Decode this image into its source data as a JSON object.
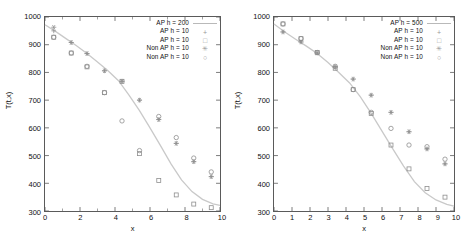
{
  "figure": {
    "background": "#ffffff",
    "panel_count": 2
  },
  "chart_data": [
    {
      "type": "scatter",
      "title": "",
      "xlabel": "x",
      "ylabel": "T(t,x)",
      "xlim": [
        0,
        10
      ],
      "ylim": [
        300,
        1000
      ],
      "xticks": [
        0,
        2,
        4,
        6,
        8,
        10
      ],
      "xtick_labels": [
        "0",
        "2",
        "4",
        "6",
        "8",
        "10"
      ],
      "xminor_ticks": [
        1,
        3,
        5,
        7,
        9
      ],
      "yticks": [
        300,
        400,
        500,
        600,
        700,
        800,
        900,
        1000
      ],
      "ytick_labels": [
        "300",
        "400",
        "500",
        "600",
        "700",
        "800",
        "900",
        "1000"
      ],
      "grid": false,
      "legend_position": "top-right",
      "line_color": "#c9c9c9",
      "marker_color": "#8e8e8e",
      "series": [
        {
          "name": "AP h = 200",
          "marker": "line",
          "x": [
            0.0,
            0.6,
            1.2,
            1.8,
            2.4,
            3.0,
            3.6,
            4.2,
            4.8,
            5.4,
            6.0,
            6.6,
            7.2,
            7.8,
            8.4,
            9.0,
            9.6,
            10.0
          ],
          "values": [
            972,
            948,
            922,
            896,
            868,
            838,
            806,
            770,
            718,
            662,
            600,
            536,
            470,
            412,
            370,
            342,
            326,
            320
          ]
        },
        {
          "name": "AP h = 10",
          "marker": "plus",
          "x": [
            0.5,
            1.5,
            2.4,
            3.4,
            4.4,
            5.4,
            6.5,
            7.5,
            8.5,
            9.5
          ],
          "values": [
            950,
            908,
            868,
            806,
            768,
            700,
            630,
            544,
            478,
            424
          ]
        },
        {
          "name": "AP h = 10",
          "marker": "square",
          "x": [
            0.5,
            1.5,
            2.4,
            3.4,
            4.4,
            5.4,
            6.5,
            7.5,
            8.5,
            9.5
          ],
          "values": [
            927,
            870,
            820,
            727,
            768,
            507,
            410,
            358,
            325,
            312
          ]
        },
        {
          "name": "Non AP h = 10",
          "marker": "star",
          "x": [
            0.5,
            1.5,
            2.4,
            3.4,
            4.4,
            5.4,
            6.5,
            7.5,
            8.5,
            9.5
          ],
          "values": [
            963,
            908,
            868,
            806,
            768,
            700,
            630,
            544,
            478,
            424
          ]
        },
        {
          "name": "Non AP h = 10",
          "marker": "circle",
          "x": [
            0.5,
            1.5,
            2.4,
            3.4,
            4.4,
            5.4,
            6.5,
            7.5,
            8.5,
            9.5
          ],
          "values": [
            927,
            870,
            822,
            727,
            625,
            518,
            641,
            565,
            491,
            441
          ]
        }
      ]
    },
    {
      "type": "scatter",
      "title": "",
      "xlabel": "x",
      "ylabel": "T(t,x)",
      "xlim": [
        0,
        10
      ],
      "ylim": [
        300,
        1000
      ],
      "xticks": [
        0,
        1,
        2,
        3,
        4,
        5,
        6,
        7,
        8,
        9,
        10
      ],
      "xtick_labels": [
        "0",
        "1",
        "2",
        "3",
        "4",
        "5",
        "6",
        "7",
        "8",
        "9",
        "10"
      ],
      "xminor_ticks": [],
      "yticks": [
        300,
        400,
        500,
        600,
        700,
        800,
        900,
        1000
      ],
      "ytick_labels": [
        "300",
        "400",
        "500",
        "600",
        "700",
        "800",
        "900",
        "1000"
      ],
      "grid": false,
      "legend_position": "top-right",
      "line_color": "#c9c9c9",
      "marker_color": "#8e8e8e",
      "series": [
        {
          "name": "AP h = 500",
          "marker": "line",
          "x": [
            0.0,
            0.6,
            1.2,
            1.8,
            2.4,
            3.0,
            3.6,
            4.2,
            4.8,
            5.4,
            6.0,
            6.6,
            7.2,
            7.8,
            8.4,
            9.0,
            9.6,
            10.0
          ],
          "values": [
            975,
            946,
            920,
            895,
            868,
            836,
            800,
            762,
            712,
            652,
            588,
            524,
            462,
            406,
            366,
            340,
            324,
            318
          ]
        },
        {
          "name": "AP h = 10",
          "marker": "plus",
          "x": [
            0.5,
            1.5,
            2.4,
            3.4,
            4.4,
            5.4,
            6.5,
            7.5,
            8.5,
            9.5
          ],
          "values": [
            946,
            910,
            870,
            820,
            776,
            718,
            656,
            586,
            524,
            470
          ]
        },
        {
          "name": "AP h = 10",
          "marker": "square",
          "x": [
            0.5,
            1.5,
            2.4,
            3.4,
            4.4,
            5.4,
            6.5,
            7.5,
            8.5,
            9.5
          ],
          "values": [
            975,
            922,
            872,
            815,
            738,
            652,
            538,
            452,
            381,
            350
          ]
        },
        {
          "name": "Non AP h = 10",
          "marker": "star",
          "x": [
            0.5,
            1.5,
            2.4,
            3.4,
            4.4,
            5.4,
            6.5,
            7.5,
            8.5,
            9.5
          ],
          "values": [
            946,
            910,
            870,
            820,
            776,
            718,
            656,
            586,
            524,
            470
          ]
        },
        {
          "name": "Non AP h = 10",
          "marker": "circle",
          "x": [
            0.5,
            1.5,
            2.4,
            3.4,
            4.4,
            5.4,
            6.5,
            7.5,
            8.5,
            9.5
          ],
          "values": [
            975,
            922,
            872,
            822,
            738,
            656,
            598,
            538,
            532,
            487
          ]
        }
      ]
    }
  ]
}
